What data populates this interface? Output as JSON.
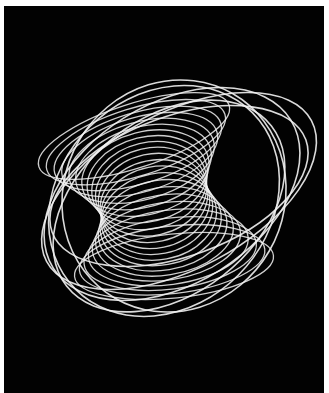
{
  "image": {
    "subject": "harmonograph-curve",
    "background_color": "#020202",
    "stroke_color": "#f2f2f2",
    "frame_color": "#ffffff"
  },
  "curves": {
    "outer": [
      {
        "cx": 175,
        "cy": 185,
        "rx": 150,
        "ry": 78,
        "rot": -28
      },
      {
        "cx": 168,
        "cy": 188,
        "rx": 140,
        "ry": 90,
        "rot": -32
      },
      {
        "cx": 160,
        "cy": 195,
        "rx": 125,
        "ry": 105,
        "rot": -45
      },
      {
        "cx": 175,
        "cy": 180,
        "rx": 135,
        "ry": 70,
        "rot": -20
      },
      {
        "cx": 165,
        "cy": 200,
        "rx": 130,
        "ry": 88,
        "rot": -38
      },
      {
        "cx": 170,
        "cy": 190,
        "rx": 118,
        "ry": 110,
        "rot": -60
      }
    ],
    "inner_count": 22
  }
}
